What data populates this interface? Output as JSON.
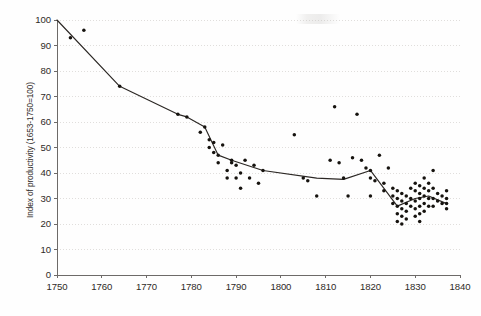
{
  "chart_data": {
    "type": "scatter",
    "title": "",
    "xlabel": "",
    "ylabel": "Index of productivity (1653-1750=100)",
    "xlim": [
      1750,
      1840
    ],
    "ylim": [
      0,
      100
    ],
    "xticks": [
      1750,
      1760,
      1770,
      1780,
      1790,
      1800,
      1810,
      1820,
      1830,
      1840
    ],
    "yticks": [
      0,
      10,
      20,
      30,
      40,
      50,
      60,
      70,
      80,
      90,
      100
    ],
    "grid": true,
    "grid_axis": "y",
    "legend": "none",
    "point_color": "#16130f",
    "line_color": "#2b2724",
    "series": [
      {
        "name": "Observations",
        "type": "scatter",
        "points": [
          [
            1753,
            93
          ],
          [
            1756,
            96
          ],
          [
            1764,
            74
          ],
          [
            1777,
            63
          ],
          [
            1779,
            62
          ],
          [
            1782,
            56
          ],
          [
            1783,
            58
          ],
          [
            1784,
            50
          ],
          [
            1784,
            53
          ],
          [
            1785,
            52
          ],
          [
            1785,
            48
          ],
          [
            1786,
            47
          ],
          [
            1786,
            44
          ],
          [
            1787,
            51
          ],
          [
            1788,
            41
          ],
          [
            1788,
            38
          ],
          [
            1789,
            44
          ],
          [
            1789,
            45
          ],
          [
            1790,
            43
          ],
          [
            1790,
            38
          ],
          [
            1791,
            40
          ],
          [
            1791,
            34
          ],
          [
            1792,
            45
          ],
          [
            1793,
            38
          ],
          [
            1794,
            43
          ],
          [
            1795,
            36
          ],
          [
            1796,
            41
          ],
          [
            1803,
            55
          ],
          [
            1805,
            38
          ],
          [
            1806,
            37
          ],
          [
            1808,
            31
          ],
          [
            1811,
            45
          ],
          [
            1812,
            66
          ],
          [
            1813,
            44
          ],
          [
            1814,
            38
          ],
          [
            1815,
            31
          ],
          [
            1816,
            46
          ],
          [
            1817,
            63
          ],
          [
            1818,
            45
          ],
          [
            1819,
            42
          ],
          [
            1820,
            41
          ],
          [
            1820,
            38
          ],
          [
            1820,
            31
          ],
          [
            1821,
            37
          ],
          [
            1822,
            47
          ],
          [
            1823,
            36
          ],
          [
            1823,
            33
          ],
          [
            1824,
            42
          ],
          [
            1825,
            34
          ],
          [
            1825,
            31
          ],
          [
            1825,
            28
          ],
          [
            1826,
            33
          ],
          [
            1826,
            30
          ],
          [
            1826,
            27
          ],
          [
            1826,
            24
          ],
          [
            1826,
            21
          ],
          [
            1827,
            32
          ],
          [
            1827,
            29
          ],
          [
            1827,
            26
          ],
          [
            1827,
            23
          ],
          [
            1827,
            20
          ],
          [
            1828,
            31
          ],
          [
            1828,
            28
          ],
          [
            1828,
            25
          ],
          [
            1828,
            22
          ],
          [
            1829,
            34
          ],
          [
            1829,
            30
          ],
          [
            1829,
            27
          ],
          [
            1830,
            36
          ],
          [
            1830,
            33
          ],
          [
            1830,
            29
          ],
          [
            1830,
            26
          ],
          [
            1830,
            23
          ],
          [
            1831,
            35
          ],
          [
            1831,
            32
          ],
          [
            1831,
            30
          ],
          [
            1831,
            27
          ],
          [
            1831,
            24
          ],
          [
            1831,
            21
          ],
          [
            1832,
            38
          ],
          [
            1832,
            34
          ],
          [
            1832,
            31
          ],
          [
            1832,
            28
          ],
          [
            1832,
            25
          ],
          [
            1833,
            36
          ],
          [
            1833,
            33
          ],
          [
            1833,
            30
          ],
          [
            1833,
            27
          ],
          [
            1834,
            41
          ],
          [
            1834,
            34
          ],
          [
            1834,
            30
          ],
          [
            1834,
            27
          ],
          [
            1835,
            32
          ],
          [
            1835,
            29
          ],
          [
            1836,
            31
          ],
          [
            1836,
            28
          ],
          [
            1837,
            33
          ],
          [
            1837,
            30
          ],
          [
            1837,
            28
          ],
          [
            1837,
            26
          ]
        ]
      },
      {
        "name": "Trend",
        "type": "line",
        "points": [
          [
            1750,
            100
          ],
          [
            1764,
            74
          ],
          [
            1777,
            63
          ],
          [
            1779,
            62
          ],
          [
            1783,
            58
          ],
          [
            1786,
            47
          ],
          [
            1789,
            45
          ],
          [
            1796,
            41
          ],
          [
            1808,
            38
          ],
          [
            1814,
            37.5
          ],
          [
            1820,
            41
          ],
          [
            1826,
            27
          ],
          [
            1830,
            30
          ],
          [
            1833,
            31
          ],
          [
            1837,
            28
          ]
        ]
      }
    ]
  }
}
